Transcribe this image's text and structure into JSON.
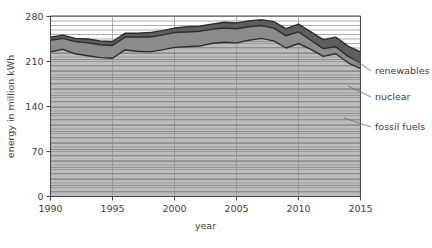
{
  "chart_data": {
    "type": "area",
    "stacked": true,
    "title": "",
    "xlabel": "year",
    "ylabel": "energy in million kWh",
    "x": [
      1990,
      1991,
      1992,
      1993,
      1994,
      1995,
      1996,
      1997,
      1998,
      1999,
      2000,
      2001,
      2002,
      2003,
      2004,
      2005,
      2006,
      2007,
      2008,
      2009,
      2010,
      2011,
      2012,
      2013,
      2014,
      2015
    ],
    "xlim": [
      1990,
      2015
    ],
    "ylim": [
      0,
      280
    ],
    "xticks": [
      1990,
      1995,
      2000,
      2005,
      2010,
      2015
    ],
    "yticks": [
      0,
      70,
      140,
      210,
      280
    ],
    "xticklabels": [
      "1990",
      "1995",
      "2000",
      "2005",
      "2010",
      "2015"
    ],
    "yticklabels": [
      "0",
      "70",
      "140",
      "210",
      "280"
    ],
    "grid": "both",
    "legend_position": "right-outside",
    "series": [
      {
        "name": "fossil fuels",
        "color": "#b9b9b9",
        "values": [
          225,
          229,
          222,
          219,
          216,
          215,
          228,
          226,
          225,
          228,
          232,
          233,
          234,
          238,
          240,
          239,
          243,
          246,
          242,
          231,
          238,
          229,
          218,
          222,
          208,
          199
        ]
      },
      {
        "name": "nuclear",
        "color": "#8c8c8c",
        "values": [
          18,
          17,
          19,
          20,
          20,
          20,
          20,
          22,
          23,
          23,
          23,
          23,
          23,
          22,
          22,
          22,
          21,
          20,
          20,
          19,
          18,
          14,
          12,
          11,
          10,
          9
        ]
      },
      {
        "name": "renewables",
        "color": "#5e5e5e",
        "values": [
          5,
          5,
          5,
          6,
          6,
          6,
          6,
          6,
          7,
          7,
          7,
          8,
          8,
          8,
          9,
          9,
          9,
          9,
          10,
          11,
          12,
          13,
          14,
          15,
          16,
          17
        ]
      }
    ],
    "totals": [
      248,
      251,
      246,
      245,
      242,
      241,
      254,
      254,
      255,
      258,
      262,
      264,
      265,
      268,
      271,
      270,
      273,
      275,
      272,
      261,
      268,
      256,
      244,
      248,
      234,
      225
    ]
  },
  "legend": {
    "items": [
      {
        "label": "renewables"
      },
      {
        "label": "nuclear"
      },
      {
        "label": "fossil fuels"
      }
    ]
  }
}
